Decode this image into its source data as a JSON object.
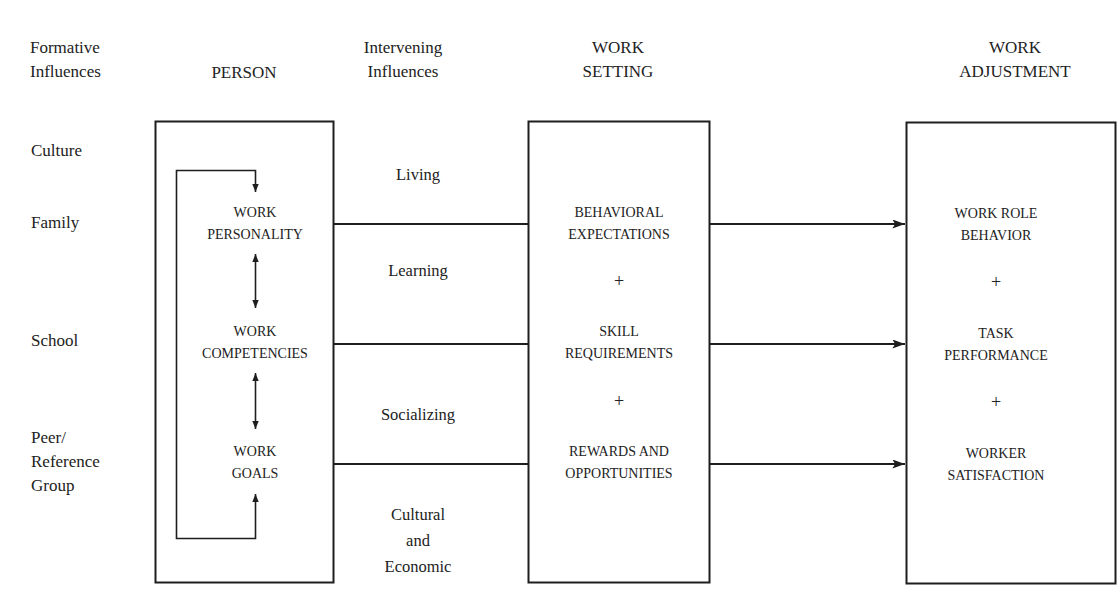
{
  "headers": {
    "formative": [
      "Formative",
      "Influences"
    ],
    "person": "PERSON",
    "intervening": [
      "Intervening",
      "Influences"
    ],
    "work_setting": [
      "WORK",
      "SETTING"
    ],
    "work_adjustment": [
      "WORK",
      "ADJUSTMENT"
    ]
  },
  "formative_influences": [
    {
      "label": "Culture"
    },
    {
      "label": "Family"
    },
    {
      "label": "School"
    },
    {
      "label": "Peer/",
      "label2": "Reference",
      "label3": "Group"
    }
  ],
  "person": {
    "items": [
      {
        "line1": "WORK",
        "line2": "PERSONALITY"
      },
      {
        "line1": "WORK",
        "line2": "COMPETENCIES"
      },
      {
        "line1": "WORK",
        "line2": "GOALS"
      }
    ]
  },
  "intervening_influences": [
    {
      "label": "Living"
    },
    {
      "label": "Learning"
    },
    {
      "label": "Socializing"
    },
    {
      "line1": "Cultural",
      "line2": "and",
      "line3": "Economic"
    }
  ],
  "work_setting": {
    "items": [
      {
        "line1": "BEHAVIORAL",
        "line2": "EXPECTATIONS"
      },
      {
        "line1": "SKILL",
        "line2": "REQUIREMENTS"
      },
      {
        "line1": "REWARDS AND",
        "line2": "OPPORTUNITIES"
      }
    ],
    "plus": "+"
  },
  "work_adjustment": {
    "items": [
      {
        "line1": "WORK ROLE",
        "line2": "BEHAVIOR"
      },
      {
        "line1": "TASK",
        "line2": "PERFORMANCE"
      },
      {
        "line1": "WORKER",
        "line2": "SATISFACTION"
      }
    ],
    "plus": "+"
  },
  "colors": {
    "line": "#1e1e1e",
    "text": "#222222",
    "background": "#ffffff"
  }
}
